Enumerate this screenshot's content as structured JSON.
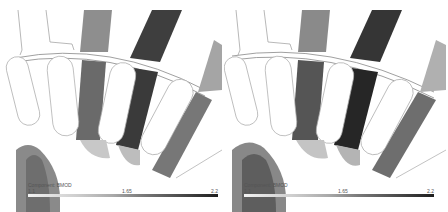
{
  "panels": [
    {
      "id": "left",
      "legend": {
        "title": "Component: BMOD",
        "min": "1.1",
        "mid": "1.65",
        "max": "2.2"
      }
    },
    {
      "id": "right",
      "legend": {
        "title": "Component: BMOD",
        "min": "1.1",
        "mid": "1.65",
        "max": "2.2"
      }
    }
  ],
  "colors": {
    "low": "#f2f2f2",
    "mid": "#8a8a8a",
    "high": "#1e1e1e",
    "outline": "#9a9a9a"
  }
}
